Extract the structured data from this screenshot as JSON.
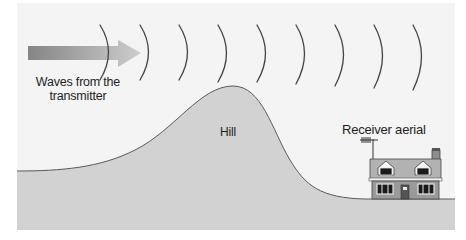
{
  "labels": {
    "waves_line1": "Waves from the",
    "waves_line2": "transmitter",
    "hill": "Hill",
    "receiver": "Receiver aerial"
  },
  "elements": {
    "wave_arcs_count": 9,
    "arrow_direction": "right",
    "house": "two-storey house with dormer windows, chimney and rooftop aerial"
  },
  "colors": {
    "background_panel": "#f4f4f4",
    "ground": "#d4d4d4",
    "hill": "#cfcfcf",
    "outline": "#555555",
    "arrow_start": "#858585",
    "arrow_end": "#cccccc",
    "house_wall": "#9a9a9a",
    "house_roof": "#b0b0b0"
  }
}
